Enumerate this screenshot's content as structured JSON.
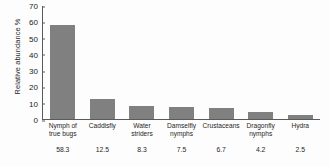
{
  "chart_data": {
    "type": "bar",
    "title": "",
    "xlabel": "",
    "ylabel": "Relative abundance %",
    "ylim": [
      0,
      70
    ],
    "yticks": [
      70,
      60,
      50,
      40,
      30,
      20,
      10,
      0
    ],
    "grid": false,
    "legend": false,
    "bar_color": "#808080",
    "categories": [
      "Nymph of true bugs",
      "Caddisfly",
      "Water striders",
      "Damselfly nymphs",
      "Crustaceans",
      "Dragonfly nymphs",
      "Hydra"
    ],
    "category_lines": [
      [
        "Nymph of",
        "true bugs"
      ],
      [
        "Caddisfly"
      ],
      [
        "Water",
        "striders"
      ],
      [
        "Damselfly",
        "nymphs"
      ],
      [
        "Crustaceans"
      ],
      [
        "Dragonfly",
        "nymphs"
      ],
      [
        "Hydra"
      ]
    ],
    "values": [
      58.3,
      12.5,
      8.3,
      7.5,
      6.7,
      4.2,
      2.5
    ],
    "value_labels": [
      "58.3",
      "12.5",
      "8.3",
      "7.5",
      "6.7",
      "4.2",
      "2.5"
    ]
  }
}
